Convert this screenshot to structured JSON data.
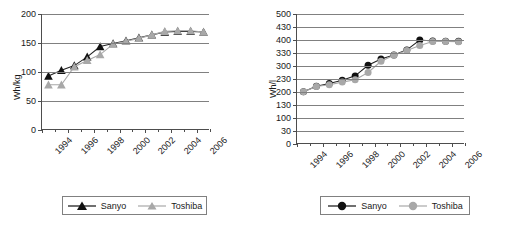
{
  "figure": {
    "panels": [
      "gravimetric-energy-density",
      "volumetric-energy-density"
    ]
  },
  "chart_data": [
    {
      "type": "line",
      "title": "",
      "xlabel": "",
      "ylabel": "Wh/kg",
      "ylim": [
        0,
        200
      ],
      "xlim": [
        1994,
        2007
      ],
      "grid": true,
      "legend_position": "bottom",
      "ytick_labels": [
        "200",
        "150",
        "100",
        "50",
        "0"
      ],
      "ytick_values": [
        200,
        150,
        100,
        50,
        0
      ],
      "xtick_labels": [
        "1994",
        "1996",
        "1998",
        "2000",
        "2002",
        "2004",
        "2006"
      ],
      "xtick_values": [
        1994,
        1996,
        1998,
        2000,
        2002,
        2004,
        2006
      ],
      "x": [
        1994.5,
        1995.5,
        1996.5,
        1997.5,
        1998.5,
        1999.5,
        2000.5,
        2001.5,
        2002.5,
        2003.5,
        2004.5,
        2005.5,
        2006.5
      ],
      "series": [
        {
          "name": "Sanyo",
          "marker": "triangle",
          "color": "#111111",
          "values": [
            93,
            103,
            111,
            126,
            144,
            149,
            154,
            159,
            164,
            169,
            170,
            170,
            169
          ]
        },
        {
          "name": "Toshiba",
          "marker": "triangle",
          "color": "#a8a8a8",
          "values": [
            78,
            78,
            109,
            120,
            130,
            148,
            153,
            158,
            164,
            170,
            171,
            171,
            169
          ]
        }
      ]
    },
    {
      "type": "line",
      "title": "",
      "xlabel": "",
      "ylabel": "Wh/l",
      "ylim": [
        0,
        500
      ],
      "xlim": [
        1994,
        2007
      ],
      "grid": true,
      "legend_position": "bottom",
      "ytick_labels": [
        "500",
        "430",
        "400",
        "330",
        "300",
        "230",
        "200",
        "130",
        "100",
        "30",
        "0"
      ],
      "ytick_values": [
        500,
        450,
        400,
        350,
        300,
        250,
        200,
        150,
        100,
        50,
        0
      ],
      "xtick_labels": [
        "1994",
        "1996",
        "1998",
        "2000",
        "2002",
        "2004",
        "2006"
      ],
      "xtick_values": [
        1994,
        1996,
        1998,
        2000,
        2002,
        2004,
        2006
      ],
      "x": [
        1994.5,
        1995.5,
        1996.5,
        1997.5,
        1998.5,
        1999.5,
        2000.5,
        2001.5,
        2002.5,
        2003.5,
        2004.5,
        2005.5,
        2006.5
      ],
      "series": [
        {
          "name": "Sanyo",
          "marker": "circle",
          "color": "#111111",
          "values": [
            201,
            222,
            233,
            245,
            262,
            303,
            327,
            342,
            362,
            400,
            396,
            395,
            395
          ]
        },
        {
          "name": "Toshiba",
          "marker": "circle",
          "color": "#a8a8a8",
          "values": [
            201,
            221,
            228,
            238,
            247,
            275,
            318,
            341,
            360,
            379,
            394,
            394,
            393
          ]
        }
      ]
    }
  ],
  "legend": {
    "left": {
      "entries": [
        {
          "label": "Sanyo"
        },
        {
          "label": "Toshiba"
        }
      ]
    },
    "right": {
      "entries": [
        {
          "label": "Sanyo"
        },
        {
          "label": "Toshiba"
        }
      ]
    }
  }
}
